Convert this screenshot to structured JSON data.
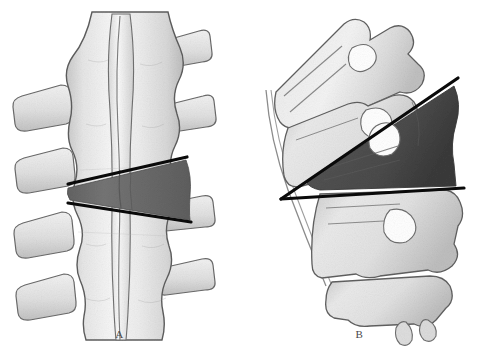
{
  "figure": {
    "kind": "anatomical-illustration",
    "background_color": "#ffffff",
    "width": 479,
    "height": 348
  },
  "palette": {
    "bone_light": "#f3f3f3",
    "bone_mid": "#dedede",
    "bone_shadow": "#b9b9b9",
    "bone_outline": "#5d5d5d",
    "highlight_vertebra_a": "#6f6f6f",
    "highlight_vertebra_b": "#4d4d4d",
    "measurement_line": "#0a0a0a",
    "caption_color": "#4a4a4a"
  },
  "panels": [
    {
      "id": "a",
      "caption": "A",
      "view": "anteroposterior",
      "description": "Anteroposterior view of lumbar vertebrae with transverse processes; one vertebral body is shaded dark and bracketed by two converging endplate lines.",
      "highlight": {
        "name": "shaded-vertebral-body",
        "fill": "#6f6f6f"
      },
      "measurement_lines": [
        {
          "name": "superior-endplate-line",
          "x1": 68,
          "y1": 184,
          "x2": 187,
          "y2": 157,
          "stroke": "#0a0a0a",
          "stroke_width": 3.2
        },
        {
          "name": "inferior-endplate-line",
          "x1": 68,
          "y1": 203,
          "x2": 191,
          "y2": 222,
          "stroke": "#0a0a0a",
          "stroke_width": 3.2
        }
      ],
      "vertebrae_count": 4
    },
    {
      "id": "b",
      "caption": "B",
      "view": "lateral",
      "description": "Lateral view of lumbar vertebrae in lordosis; one vertebral body is shaded dark and two measurement lines converge to a vertex anterior to the spine.",
      "highlight": {
        "name": "shaded-vertebral-body",
        "fill": "#4d4d4d"
      },
      "measurement_lines": [
        {
          "name": "superior-endplate-line",
          "x1": 41,
          "y1": 199,
          "x2": 218,
          "y2": 78,
          "stroke": "#0a0a0a",
          "stroke_width": 3.2
        },
        {
          "name": "inferior-endplate-line",
          "x1": 41,
          "y1": 199,
          "x2": 224,
          "y2": 188,
          "stroke": "#0a0a0a",
          "stroke_width": 3.2
        }
      ],
      "vertex": {
        "name": "angle-vertex",
        "x": 41,
        "y": 199
      },
      "vertebrae_count": 4
    }
  ]
}
